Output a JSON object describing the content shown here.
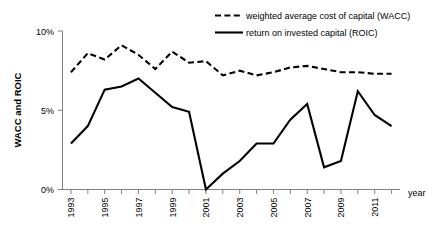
{
  "chart_data": {
    "type": "line",
    "title": "",
    "xlabel": "year",
    "ylabel": "WACC and ROIC",
    "xlim": [
      1992.5,
      2012.5
    ],
    "ylim": [
      0,
      10
    ],
    "grid": false,
    "legend_position": "top-right",
    "x": [
      1993,
      1994,
      1995,
      1996,
      1997,
      1998,
      1999,
      2000,
      2001,
      2002,
      2003,
      2004,
      2005,
      2006,
      2007,
      2008,
      2009,
      2010,
      2011,
      2012
    ],
    "x_tick_labels": [
      "1993",
      "",
      "1995",
      "",
      "1997",
      "",
      "1999",
      "",
      "2001",
      "",
      "2003",
      "",
      "2005",
      "",
      "2007",
      "",
      "2009",
      "",
      "2011",
      ""
    ],
    "y_tick_labels": [
      "0%",
      "5%",
      "10%"
    ],
    "y_ticks": [
      0,
      5,
      10
    ],
    "series": [
      {
        "name": "weighted average cost of capital (WACC)",
        "style": "dashed",
        "color": "#000000",
        "values": [
          7.4,
          8.6,
          8.2,
          9.1,
          8.5,
          7.6,
          8.7,
          8.0,
          8.1,
          7.2,
          7.5,
          7.2,
          7.4,
          7.7,
          7.8,
          7.6,
          7.4,
          7.4,
          7.3,
          7.3
        ]
      },
      {
        "name": "return on invested capital (ROIC)",
        "style": "solid",
        "color": "#000000",
        "values": [
          2.9,
          4.0,
          6.3,
          6.5,
          7.0,
          6.1,
          5.2,
          4.9,
          0.0,
          1.0,
          1.8,
          2.9,
          2.9,
          4.4,
          5.4,
          1.4,
          1.8,
          6.2,
          4.7,
          4.0
        ]
      }
    ]
  },
  "legend": {
    "entries": [
      {
        "label": "weighted average cost of capital (WACC)",
        "style": "dashed"
      },
      {
        "label": "return on invested capital (ROIC)",
        "style": "solid"
      }
    ]
  },
  "axes": {
    "y_axis_title": "WACC and ROIC",
    "x_axis_title": "year",
    "y_labels": [
      "10%",
      "5%",
      "0%"
    ],
    "x_labels": [
      "1993",
      "1995",
      "1997",
      "1999",
      "2001",
      "2003",
      "2005",
      "2007",
      "2009",
      "2011"
    ]
  }
}
